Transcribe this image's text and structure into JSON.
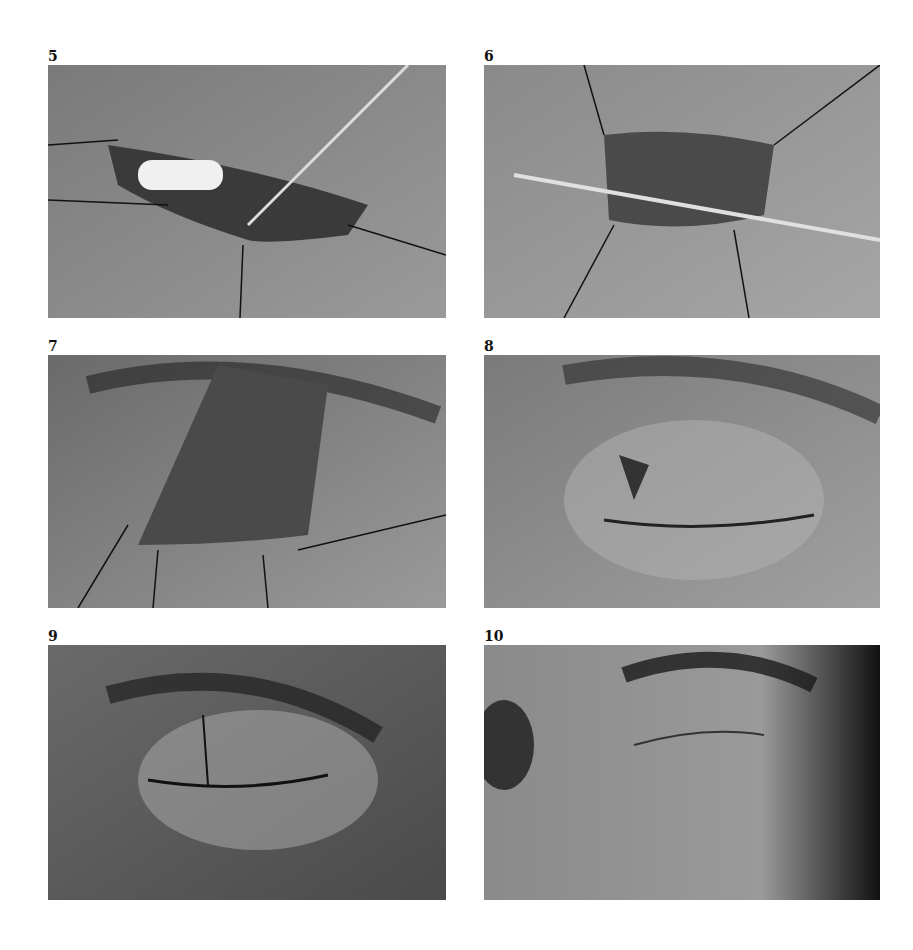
{
  "figure": {
    "panels": [
      {
        "number": "5",
        "description": "Surgical photograph: eyelid wound opened with traction sutures, white implant visible, probe inserted"
      },
      {
        "number": "6",
        "description": "Surgical photograph: eyelid wound with sutures and horizontal probe across the wound"
      },
      {
        "number": "7",
        "description": "Surgical photograph: wide exposed eyelid wound with traction sutures, eyebrow hairs above"
      },
      {
        "number": "8",
        "description": "Surgical photograph: closed eyelid with partial suture line along the lid margin"
      },
      {
        "number": "9",
        "description": "Surgical photograph: sutured eyelid with complete closure suture line"
      },
      {
        "number": "10",
        "description": "Postoperative photograph: healed eyelid closed, eyebrow above"
      }
    ]
  }
}
